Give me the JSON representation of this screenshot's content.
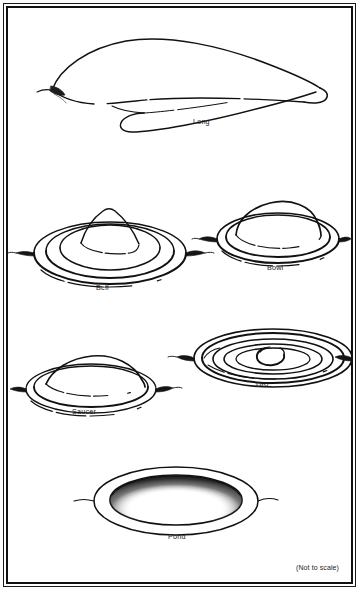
{
  "figure": {
    "scale_note": "(Not to scale)",
    "background_color": "#ffffff",
    "ink_color": "#111111",
    "frame": {
      "style": "double-rule",
      "outer_color": "#1a1a1a",
      "inner_color": "#111111"
    },
    "shapes": [
      {
        "id": "long",
        "label": "Long",
        "row": 1,
        "column": "center",
        "description": "Elongated tapering cigar-shaped form with pointed left tip, rounded right end and a trailing skirt line beneath"
      },
      {
        "id": "bell",
        "label": "Bell",
        "row": 2,
        "column": "left",
        "description": "Tall conical bell-shaped dome seated on a wide multi-ringed elliptical brim"
      },
      {
        "id": "bowl",
        "label": "Bowl",
        "row": 2,
        "column": "right",
        "description": "Rounded inverted bowl dome on a narrow double-ringed elliptical rim with pointed side flares"
      },
      {
        "id": "saucer",
        "label": "Saucer",
        "row": 3,
        "column": "left",
        "description": "Low smooth dome resting on a single thin elliptical saucer rim with pointed side flares"
      },
      {
        "id": "disc",
        "label": "Disc",
        "row": 3,
        "column": "right",
        "description": "Flat concentric-ringed ellipse seen from above with a small hooked curl mark at the center"
      },
      {
        "id": "pond",
        "label": "Pond",
        "row": 4,
        "column": "center",
        "description": "Flat open annulus like a pond rim, with dense stippled shading along the inner lower edge"
      }
    ]
  }
}
